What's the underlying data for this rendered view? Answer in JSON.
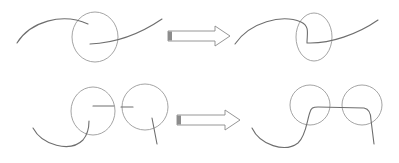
{
  "diagram": {
    "colors": {
      "curve": "#6e6e6e",
      "circle": "#9a9a9a",
      "arrow_outline": "#8a8a8a",
      "arrow_tail": "#8c8c8c",
      "background": "#ffffff"
    },
    "rows": [
      {
        "name": "single-circle",
        "before": {
          "circles": [
            {
              "cx": 95,
              "cy": 37,
              "rx": 23,
              "ry": 25
            }
          ],
          "curves": [
            "M17,43 C30,22 62,12 88,24",
            "M90,44 C115,43 140,34 162,19"
          ]
        },
        "arrow": {
          "x": 168,
          "y": 31,
          "shaft_end": 215,
          "tip_x": 230,
          "tip_y": 36,
          "height": 10,
          "head_half": 10
        },
        "after": {
          "circles": [
            {
              "cx": 314,
              "cy": 37,
              "rx": 18,
              "ry": 24
            }
          ],
          "curves": [
            "M235,44 C250,22 282,14 301,22 C310,26 307,34 307,43 C330,44 358,34 378,20"
          ]
        }
      },
      {
        "name": "two-circles",
        "before": {
          "circles": [
            {
              "cx": 93,
              "cy": 111,
              "rx": 22,
              "ry": 24
            },
            {
              "cx": 145,
              "cy": 107,
              "rx": 23,
              "ry": 23
            }
          ],
          "curves": [
            "M33,128 C42,145 70,153 83,140 C88,134 89,126 89,121",
            "M93,106 L114,106",
            "M121,107 L133,107",
            "M152,118 L157,144"
          ]
        },
        "arrow": {
          "x": 177,
          "y": 115,
          "shaft_end": 225,
          "tip_x": 240,
          "tip_y": 120,
          "height": 10,
          "head_half": 10
        },
        "after": {
          "circles": [
            {
              "cx": 310,
              "cy": 105,
              "rx": 20,
              "ry": 20
            },
            {
              "cx": 362,
              "cy": 105,
              "rx": 20,
              "ry": 20
            }
          ],
          "curves": [
            "M252,128 C260,145 285,153 298,143 C306,136 307,120 310,112 C311,108 313,107 318,107 L364,108 C369,109 371,114 371,120 L374,144"
          ]
        }
      }
    ]
  }
}
